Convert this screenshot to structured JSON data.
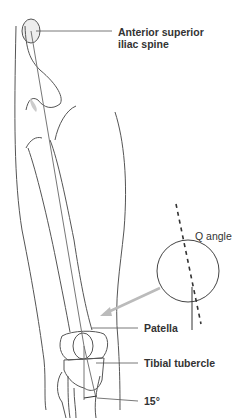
{
  "diagram": {
    "labels": {
      "asis_line1": "Anterior superior",
      "asis_line2": "iliac spine",
      "q_angle": "Q angle",
      "patella": "Patella",
      "tibial_tubercle": "Tibial tubercle",
      "angle_value": "15°"
    },
    "colors": {
      "outline": "#555555",
      "shade": "#d8d8d8",
      "arrow": "#bbbbbb",
      "text": "#333333"
    }
  }
}
